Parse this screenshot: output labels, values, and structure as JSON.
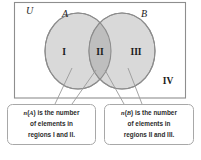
{
  "diagram": {
    "type": "venn-diagram",
    "universe_label": "U",
    "set_labels": {
      "left": "A",
      "right": "B"
    },
    "regions": [
      {
        "id": "region-1",
        "label": "I",
        "description": "A only"
      },
      {
        "id": "region-2",
        "label": "II",
        "description": "A and B intersection"
      },
      {
        "id": "region-3",
        "label": "III",
        "description": "B only"
      },
      {
        "id": "region-4",
        "label": "IV",
        "description": "outside A and B"
      }
    ],
    "colors": {
      "circle_fill": "#d9d9d9",
      "intersection_fill": "#bfbfbf",
      "circle_stroke": "#8c8c8c",
      "rect_stroke": "#8e8e8e",
      "callout_stroke": "#a8a8a8",
      "callout_fill": "#ffffff",
      "text": "#1c1c1c",
      "background": "#ffffff"
    },
    "callouts": [
      {
        "id": "callout-a",
        "lines": [
          {
            "prefix": "n",
            "paren_open": "(",
            "set": "A",
            "paren_close": ")",
            "rest": " is the number"
          },
          {
            "text": "of elements in"
          },
          {
            "text": "regions I and II."
          }
        ],
        "full_text": "n(A) is the number of elements in regions I and II.",
        "points_to": [
          "I",
          "II"
        ]
      },
      {
        "id": "callout-b",
        "lines": [
          {
            "prefix": "n",
            "paren_open": "(",
            "set": "B",
            "paren_close": ")",
            "rest": " is the number"
          },
          {
            "text": "of elements in"
          },
          {
            "text": "regions II and III."
          }
        ],
        "full_text": "n(B) is the number of elements in regions II and III.",
        "points_to": [
          "II",
          "III"
        ]
      }
    ]
  }
}
